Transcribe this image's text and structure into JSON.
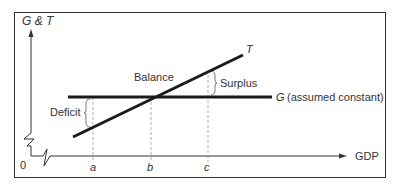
{
  "diagram": {
    "y_axis_label": "G & T",
    "x_axis_label": "GDP",
    "origin_label": "0",
    "lines": {
      "taxes": {
        "label": "T"
      },
      "government": {
        "label": "G",
        "note": "(assumed constant)"
      }
    },
    "annotations": {
      "deficit": "Deficit",
      "balance": "Balance",
      "surplus": "Surplus"
    },
    "x_ticks": [
      "a",
      "b",
      "c"
    ],
    "colors": {
      "line": "#1a1a1a",
      "axis": "#333333",
      "border": "#333333",
      "dashed": "#999999"
    }
  }
}
